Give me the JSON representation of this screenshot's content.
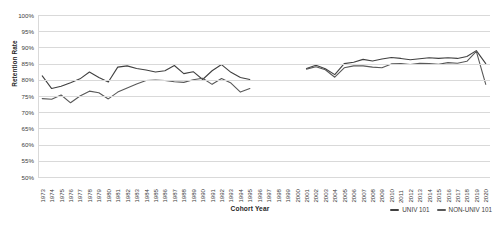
{
  "chart_data": {
    "type": "line",
    "title": "",
    "xlabel": "Cohort Year",
    "ylabel": "Retention Rate",
    "ylim": [
      50,
      100
    ],
    "ytick_labels": [
      "100%",
      "95%",
      "90%",
      "85%",
      "80%",
      "75%",
      "70%",
      "65%",
      "60%",
      "55%",
      "50%"
    ],
    "ytick_values": [
      100,
      95,
      90,
      85,
      80,
      75,
      70,
      65,
      60,
      55,
      50
    ],
    "grid": true,
    "legend_position": "bottom-right",
    "x": [
      1973,
      1974,
      1975,
      1976,
      1977,
      1978,
      1979,
      1980,
      1981,
      1982,
      1983,
      1984,
      1985,
      1986,
      1987,
      1988,
      1989,
      1990,
      1991,
      1992,
      1993,
      1994,
      1995,
      1996,
      1997,
      1998,
      1999,
      2000,
      2001,
      2002,
      2003,
      2004,
      2005,
      2006,
      2007,
      2008,
      2009,
      2010,
      2011,
      2012,
      2013,
      2014,
      2015,
      2016,
      2017,
      2018,
      2019,
      2020
    ],
    "categories": [
      "1973",
      "1974",
      "1975",
      "1976",
      "1977",
      "1978",
      "1979",
      "1980",
      "1981",
      "1982",
      "1983",
      "1984",
      "1985",
      "1986",
      "1987",
      "1988",
      "1989",
      "1990",
      "1991",
      "1992",
      "1993",
      "1994",
      "1995",
      "1996",
      "1997",
      "1998",
      "1999",
      "2000",
      "2001",
      "2002",
      "2003",
      "2004",
      "2005",
      "2006",
      "2007",
      "2008",
      "2009",
      "2010",
      "2011",
      "2012",
      "2013",
      "2014",
      "2015",
      "2016",
      "2017",
      "2018",
      "2019",
      "2020"
    ],
    "series": [
      {
        "name": "UNIV 101",
        "color": "#404040",
        "values": [
          81.2,
          77.3,
          78.0,
          79.1,
          80.3,
          82.4,
          80.7,
          79.3,
          83.9,
          84.3,
          83.5,
          83.0,
          82.4,
          82.8,
          84.4,
          81.9,
          82.5,
          80.1,
          82.8,
          84.7,
          82.3,
          80.7,
          80.1,
          null,
          null,
          null,
          null,
          null,
          83.5,
          84.5,
          83.4,
          81.6,
          85.0,
          85.4,
          86.3,
          85.8,
          86.4,
          86.9,
          86.6,
          86.2,
          86.5,
          86.8,
          86.6,
          86.8,
          86.6,
          87.2,
          89.0,
          85.0
        ]
      },
      {
        "name": "NON-UNIV 101",
        "color": "#595959",
        "values": [
          74.2,
          74.0,
          75.3,
          72.9,
          75.0,
          76.5,
          76.0,
          74.1,
          76.2,
          77.5,
          78.7,
          79.8,
          79.9,
          79.8,
          79.4,
          79.2,
          80.0,
          80.5,
          78.6,
          80.4,
          79.0,
          76.2,
          77.3,
          null,
          null,
          null,
          null,
          null,
          83.3,
          84.0,
          83.1,
          80.8,
          83.7,
          84.3,
          84.3,
          83.9,
          83.7,
          84.9,
          85.0,
          84.7,
          85.1,
          85.0,
          84.8,
          85.3,
          85.1,
          85.7,
          88.8,
          78.6
        ]
      }
    ]
  },
  "legend": {
    "items": [
      {
        "label": "UNIV 101",
        "color": "#404040"
      },
      {
        "label": "NON-UNIV 101",
        "color": "#595959"
      }
    ]
  }
}
